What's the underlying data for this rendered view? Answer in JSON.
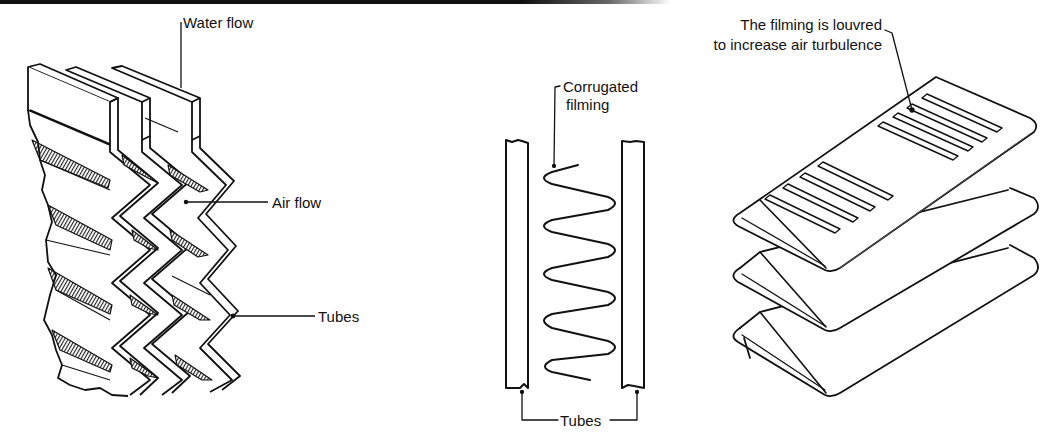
{
  "figures": [
    {
      "id": "tube-and-fin-core",
      "labels": {
        "water_flow": "Water flow",
        "air_flow": "Air flow",
        "tubes": "Tubes"
      }
    },
    {
      "id": "corrugated-filming-section",
      "labels": {
        "corrugated_line1": "Corrugated",
        "corrugated_line2": "filming",
        "tubes": "Tubes"
      }
    },
    {
      "id": "louvred-filming",
      "labels": {
        "louvre_line1": "The filming is louvred",
        "louvre_line2": "to increase air turbulence"
      }
    }
  ],
  "colors": {
    "ink": "#111111",
    "paper": "#ffffff",
    "hatch": "#444444"
  }
}
